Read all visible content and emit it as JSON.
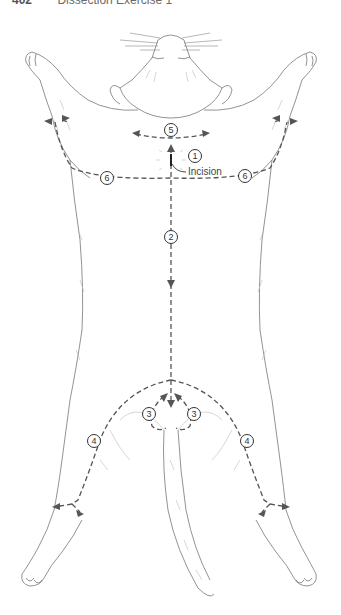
{
  "header": {
    "page_number": "402",
    "title": "Dissection Exercise 1"
  },
  "diagram": {
    "incision_label": "Incision",
    "markers": [
      {
        "id": "1",
        "label": "1"
      },
      {
        "id": "2",
        "label": "2"
      },
      {
        "id": "3a",
        "label": "3"
      },
      {
        "id": "3b",
        "label": "3"
      },
      {
        "id": "4a",
        "label": "4"
      },
      {
        "id": "4b",
        "label": "4"
      },
      {
        "id": "5",
        "label": "5"
      },
      {
        "id": "6a",
        "label": "6"
      },
      {
        "id": "6b",
        "label": "6"
      }
    ],
    "colors": {
      "outline": "#777777",
      "cut_line": "#555555",
      "marker_stroke": "#333333"
    }
  }
}
